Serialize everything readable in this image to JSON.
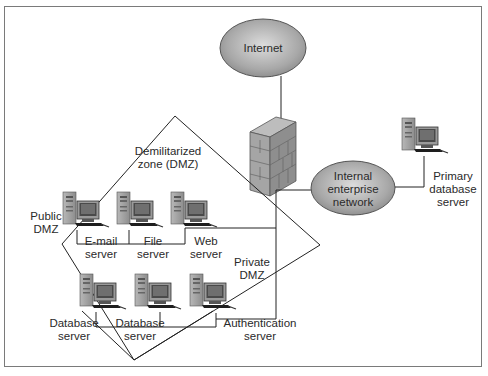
{
  "diagram": {
    "nodes": {
      "internet": {
        "label": "Internet",
        "type": "cloud-ellipse"
      },
      "firewall": {
        "label": "",
        "type": "firewall-brick-wall"
      },
      "internal_network": {
        "label": "Internal\nenterprise\nnetwork",
        "type": "cloud-ellipse"
      },
      "primary_db": {
        "label": "Primary\ndatabase\nserver",
        "type": "server"
      },
      "email_server": {
        "label": "E-mail\nserver",
        "type": "server"
      },
      "file_server": {
        "label": "File\nserver",
        "type": "server"
      },
      "web_server": {
        "label": "Web\nserver",
        "type": "server"
      },
      "db_server_1": {
        "label": "Database\nserver",
        "type": "server"
      },
      "db_server_2": {
        "label": "Database\nserver",
        "type": "server"
      },
      "auth_server": {
        "label": "Authentication\nserver",
        "type": "server"
      }
    },
    "zones": {
      "dmz": {
        "label": "Demilitarized\nzone (DMZ)"
      },
      "public_dmz": {
        "label": "Public\nDMZ"
      },
      "private_dmz": {
        "label": "Private\nDMZ"
      }
    },
    "edges": [
      [
        "internet",
        "firewall"
      ],
      [
        "firewall",
        "internal_network"
      ],
      [
        "internal_network",
        "primary_db"
      ],
      [
        "firewall",
        "public_dmz_bus"
      ],
      [
        "firewall",
        "private_dmz_bus"
      ]
    ],
    "colors": {
      "ellipse_fill": "#9a9a9a",
      "ellipse_highlight": "#d8d8d8",
      "line": "#222222",
      "frame": "#7a7a7a"
    }
  }
}
